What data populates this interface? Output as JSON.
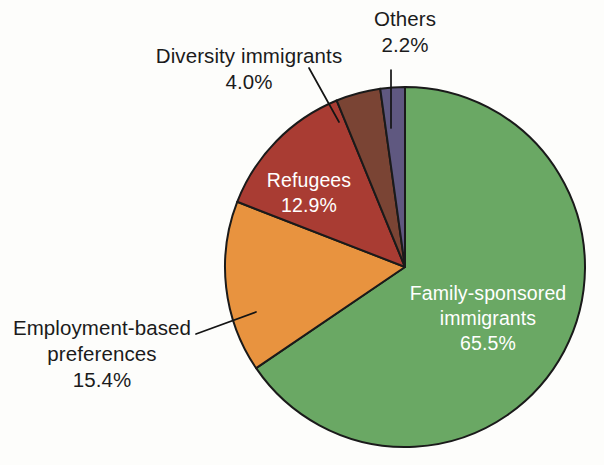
{
  "chart_data": {
    "type": "pie",
    "title": "",
    "subtitle": "",
    "xlabel": "",
    "ylabel": "",
    "legend_position": "none",
    "grid": false,
    "units": "percent",
    "total": 100.0,
    "start_angle_deg": 0,
    "direction": "clockwise",
    "categories": [
      "Family-sponsored immigrants",
      "Employment-based preferences",
      "Refugees",
      "Diversity immigrants",
      "Others"
    ],
    "values": [
      65.5,
      15.4,
      12.9,
      4.0,
      2.2
    ],
    "value_labels": [
      "65.5%",
      "15.4%",
      "12.9%",
      "4.0%",
      "2.2%"
    ],
    "colors": [
      "#6aa864",
      "#e8933f",
      "#a93c33",
      "#7a4434",
      "#5f5880"
    ],
    "slices": [
      {
        "name": "Family-sponsored immigrants",
        "name_line1": "Family-sponsored",
        "name_line2": "immigrants",
        "value": 65.5,
        "value_label": "65.5%",
        "color": "#6aa864",
        "label_placement": "inside",
        "label_color": "#ffffff",
        "has_leader_line": false
      },
      {
        "name": "Employment-based preferences",
        "name_line1": "Employment-based",
        "name_line2": "preferences",
        "value": 15.4,
        "value_label": "15.4%",
        "color": "#e8933f",
        "label_placement": "outside",
        "label_color": "#1b1b1b",
        "has_leader_line": true
      },
      {
        "name": "Refugees",
        "name_line1": "Refugees",
        "name_line2": "",
        "value": 12.9,
        "value_label": "12.9%",
        "color": "#a93c33",
        "label_placement": "inside",
        "label_color": "#ffffff",
        "has_leader_line": false
      },
      {
        "name": "Diversity immigrants",
        "name_line1": "Diversity immigrants",
        "name_line2": "",
        "value": 4.0,
        "value_label": "4.0%",
        "color": "#7a4434",
        "label_placement": "outside",
        "label_color": "#1b1b1b",
        "has_leader_line": true
      },
      {
        "name": "Others",
        "name_line1": "Others",
        "name_line2": "",
        "value": 2.2,
        "value_label": "2.2%",
        "color": "#5f5880",
        "label_placement": "outside",
        "label_color": "#1b1b1b",
        "has_leader_line": true
      }
    ]
  },
  "labels": {
    "others": {
      "name": "Others",
      "pct": "2.2%"
    },
    "diversity": {
      "name": "Diversity immigrants",
      "pct": "4.0%"
    },
    "refugees": {
      "name": "Refugees",
      "pct": "12.9%"
    },
    "family": {
      "name_line1": "Family-sponsored",
      "name_line2": "immigrants",
      "pct": "65.5%"
    },
    "employment": {
      "name_line1": "Employment-based",
      "name_line2": "preferences",
      "pct": "15.4%"
    }
  },
  "style": {
    "background": "#fdfdfb",
    "outline": "#1a1a1a",
    "text_dark": "#1b1b1b",
    "text_light": "#ffffff"
  }
}
